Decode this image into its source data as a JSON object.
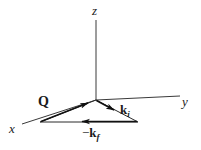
{
  "figure": {
    "kind": "3d-axes-scattering-vector-diagram",
    "width": 201,
    "height": 150,
    "background_color": "#ffffff",
    "line_color": "#3a3a3a",
    "vector_color": "#111111",
    "text_color": "#1a1a1a"
  },
  "axes": [
    {
      "id": "z",
      "label": "z",
      "direction": "up",
      "start": [
        96,
        100
      ],
      "end": [
        96,
        20
      ]
    },
    {
      "id": "y",
      "label": "y",
      "direction": "right",
      "start": [
        96,
        100
      ],
      "end": [
        180,
        96
      ]
    },
    {
      "id": "x",
      "label": "x",
      "direction": "lower-left",
      "start": [
        96,
        100
      ],
      "end": [
        22,
        124
      ]
    }
  ],
  "origin": [
    96,
    100
  ],
  "triangle": {
    "vertices": [
      [
        96,
        100
      ],
      [
        40,
        122
      ],
      [
        138,
        122
      ]
    ],
    "closed": true
  },
  "vectors": [
    {
      "id": "Q",
      "label": "Q",
      "subscript": "",
      "sign": "",
      "from": [
        40,
        122
      ],
      "to": [
        90,
        102
      ],
      "arrow_at": "to",
      "bold": true
    },
    {
      "id": "ki",
      "label": "k",
      "subscript": "i",
      "sign": "",
      "from": [
        96,
        100
      ],
      "to": [
        116,
        111
      ],
      "arrow_at": "to",
      "bold": true
    },
    {
      "id": "kf",
      "label": "k",
      "subscript": "f",
      "sign": "−",
      "from": [
        138,
        122
      ],
      "to": [
        80,
        122
      ],
      "arrow_at": "to",
      "bold": true
    }
  ],
  "labels": {
    "z": "z",
    "y": "y",
    "x": "x",
    "Q": "Q",
    "k_base": "k",
    "i_sub": "i",
    "f_sub": "f",
    "minus": "−"
  }
}
